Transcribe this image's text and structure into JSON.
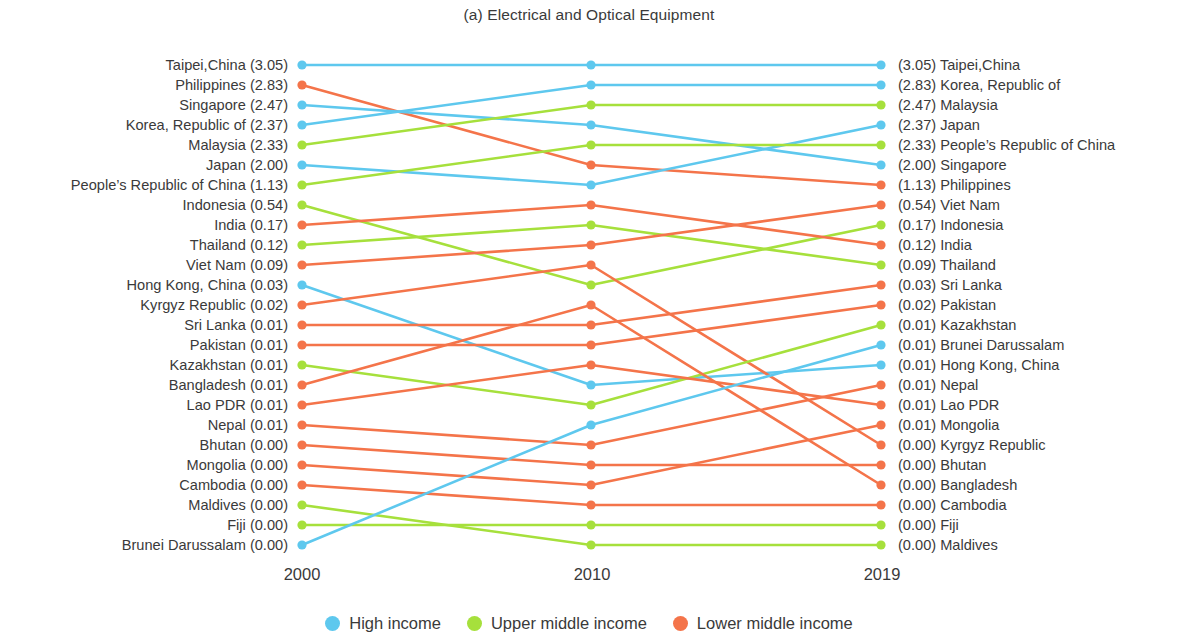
{
  "title": "(a) Electrical and Optical Equipment",
  "colors": {
    "high_income": "#5ec8ee",
    "upper_middle_income": "#a6e03c",
    "lower_middle_income": "#f4744a",
    "text": "#3a3a3a"
  },
  "axis": {
    "ticks": [
      "2000",
      "2010",
      "2019"
    ]
  },
  "legend": [
    {
      "label": "High income",
      "color": "#5ec8ee",
      "key": "high_income"
    },
    {
      "label": "Upper middle income",
      "color": "#a6e03c",
      "key": "upper_middle_income"
    },
    {
      "label": "Lower middle income",
      "color": "#f4744a",
      "key": "lower_middle_income"
    }
  ],
  "chart_data": {
    "type": "line",
    "chart_style": "bump-slope-ranking",
    "title": "(a) Electrical and Optical Equipment",
    "xlabel": "",
    "ylabel": "",
    "x": [
      "2000",
      "2010",
      "2019"
    ],
    "legend_position": "bottom-center",
    "grid": false,
    "axis_note": "Vertical position encodes rank (1 = top). Values in parentheses are shares.",
    "left_column": [
      {
        "rank": 1,
        "name": "Taipei,China",
        "value": "(3.05)",
        "income": "high_income"
      },
      {
        "rank": 2,
        "name": "Philippines",
        "value": "(2.83)",
        "income": "lower_middle_income"
      },
      {
        "rank": 3,
        "name": "Singapore",
        "value": "(2.47)",
        "income": "high_income"
      },
      {
        "rank": 4,
        "name": "Korea, Republic of",
        "value": "(2.37)",
        "income": "high_income"
      },
      {
        "rank": 5,
        "name": "Malaysia",
        "value": "(2.33)",
        "income": "upper_middle_income"
      },
      {
        "rank": 6,
        "name": "Japan",
        "value": "(2.00)",
        "income": "high_income"
      },
      {
        "rank": 7,
        "name": "People’s Republic of China",
        "value": "(1.13)",
        "income": "upper_middle_income"
      },
      {
        "rank": 8,
        "name": "Indonesia",
        "value": "(0.54)",
        "income": "upper_middle_income"
      },
      {
        "rank": 9,
        "name": "India",
        "value": "(0.17)",
        "income": "lower_middle_income"
      },
      {
        "rank": 10,
        "name": "Thailand",
        "value": "(0.12)",
        "income": "upper_middle_income"
      },
      {
        "rank": 11,
        "name": "Viet Nam",
        "value": "(0.09)",
        "income": "lower_middle_income"
      },
      {
        "rank": 12,
        "name": "Hong Kong, China",
        "value": "(0.03)",
        "income": "high_income"
      },
      {
        "rank": 13,
        "name": "Kyrgyz Republic",
        "value": "(0.02)",
        "income": "lower_middle_income"
      },
      {
        "rank": 14,
        "name": "Sri Lanka",
        "value": "(0.01)",
        "income": "lower_middle_income"
      },
      {
        "rank": 15,
        "name": "Pakistan",
        "value": "(0.01)",
        "income": "lower_middle_income"
      },
      {
        "rank": 16,
        "name": "Kazakhstan",
        "value": "(0.01)",
        "income": "upper_middle_income"
      },
      {
        "rank": 17,
        "name": "Bangladesh",
        "value": "(0.01)",
        "income": "lower_middle_income"
      },
      {
        "rank": 18,
        "name": "Lao PDR",
        "value": "(0.01)",
        "income": "lower_middle_income"
      },
      {
        "rank": 19,
        "name": "Nepal",
        "value": "(0.01)",
        "income": "lower_middle_income"
      },
      {
        "rank": 20,
        "name": "Bhutan",
        "value": "(0.00)",
        "income": "lower_middle_income"
      },
      {
        "rank": 21,
        "name": "Mongolia",
        "value": "(0.00)",
        "income": "lower_middle_income"
      },
      {
        "rank": 22,
        "name": "Cambodia",
        "value": "(0.00)",
        "income": "lower_middle_income"
      },
      {
        "rank": 23,
        "name": "Maldives",
        "value": "(0.00)",
        "income": "upper_middle_income"
      },
      {
        "rank": 24,
        "name": "Fiji",
        "value": "(0.00)",
        "income": "upper_middle_income"
      },
      {
        "rank": 25,
        "name": "Brunei Darussalam",
        "value": "(0.00)",
        "income": "high_income"
      }
    ],
    "right_column": [
      {
        "rank": 1,
        "name": "Taipei,China",
        "value": "(3.05)",
        "income": "high_income"
      },
      {
        "rank": 2,
        "name": "Korea, Republic of",
        "value": "(2.83)",
        "income": "high_income"
      },
      {
        "rank": 3,
        "name": "Malaysia",
        "value": "(2.47)",
        "income": "upper_middle_income"
      },
      {
        "rank": 4,
        "name": "Japan",
        "value": "(2.37)",
        "income": "high_income"
      },
      {
        "rank": 5,
        "name": "People’s Republic of China",
        "value": "(2.33)",
        "income": "upper_middle_income"
      },
      {
        "rank": 6,
        "name": "Singapore",
        "value": "(2.00)",
        "income": "high_income"
      },
      {
        "rank": 7,
        "name": "Philippines",
        "value": "(1.13)",
        "income": "lower_middle_income"
      },
      {
        "rank": 8,
        "name": "Viet Nam",
        "value": "(0.54)",
        "income": "lower_middle_income"
      },
      {
        "rank": 9,
        "name": "Indonesia",
        "value": "(0.17)",
        "income": "upper_middle_income"
      },
      {
        "rank": 10,
        "name": "India",
        "value": "(0.12)",
        "income": "lower_middle_income"
      },
      {
        "rank": 11,
        "name": "Thailand",
        "value": "(0.09)",
        "income": "upper_middle_income"
      },
      {
        "rank": 12,
        "name": "Sri Lanka",
        "value": "(0.03)",
        "income": "lower_middle_income"
      },
      {
        "rank": 13,
        "name": "Pakistan",
        "value": "(0.02)",
        "income": "lower_middle_income"
      },
      {
        "rank": 14,
        "name": "Kazakhstan",
        "value": "(0.01)",
        "income": "upper_middle_income"
      },
      {
        "rank": 15,
        "name": "Brunei Darussalam",
        "value": "(0.01)",
        "income": "high_income"
      },
      {
        "rank": 16,
        "name": "Hong Kong, China",
        "value": "(0.01)",
        "income": "high_income"
      },
      {
        "rank": 17,
        "name": "Nepal",
        "value": "(0.01)",
        "income": "lower_middle_income"
      },
      {
        "rank": 18,
        "name": "Lao PDR",
        "value": "(0.01)",
        "income": "lower_middle_income"
      },
      {
        "rank": 19,
        "name": "Mongolia",
        "value": "(0.01)",
        "income": "lower_middle_income"
      },
      {
        "rank": 20,
        "name": "Kyrgyz Republic",
        "value": "(0.00)",
        "income": "lower_middle_income"
      },
      {
        "rank": 21,
        "name": "Bhutan",
        "value": "(0.00)",
        "income": "lower_middle_income"
      },
      {
        "rank": 22,
        "name": "Bangladesh",
        "value": "(0.00)",
        "income": "lower_middle_income"
      },
      {
        "rank": 23,
        "name": "Cambodia",
        "value": "(0.00)",
        "income": "lower_middle_income"
      },
      {
        "rank": 24,
        "name": "Fiji",
        "value": "(0.00)",
        "income": "upper_middle_income"
      },
      {
        "rank": 25,
        "name": "Maldives",
        "value": "(0.00)",
        "income": "upper_middle_income"
      }
    ],
    "series": [
      {
        "name": "Taipei,China",
        "income": "high_income",
        "ranks": [
          1,
          1,
          1
        ],
        "values": [
          "3.05",
          "",
          "3.05"
        ]
      },
      {
        "name": "Philippines",
        "income": "lower_middle_income",
        "ranks": [
          2,
          6,
          7
        ],
        "values": [
          "2.83",
          "",
          "1.13"
        ]
      },
      {
        "name": "Singapore",
        "income": "high_income",
        "ranks": [
          3,
          4,
          6
        ],
        "values": [
          "2.47",
          "",
          "2.00"
        ]
      },
      {
        "name": "Korea, Republic of",
        "income": "high_income",
        "ranks": [
          4,
          2,
          2
        ],
        "values": [
          "2.37",
          "",
          "2.83"
        ]
      },
      {
        "name": "Malaysia",
        "income": "upper_middle_income",
        "ranks": [
          5,
          3,
          3
        ],
        "values": [
          "2.33",
          "",
          "2.47"
        ]
      },
      {
        "name": "Japan",
        "income": "high_income",
        "ranks": [
          6,
          7,
          4
        ],
        "values": [
          "2.00",
          "",
          "2.37"
        ]
      },
      {
        "name": "People’s Republic of China",
        "income": "upper_middle_income",
        "ranks": [
          7,
          5,
          5
        ],
        "values": [
          "1.13",
          "",
          "2.33"
        ]
      },
      {
        "name": "Indonesia",
        "income": "upper_middle_income",
        "ranks": [
          8,
          12,
          9
        ],
        "values": [
          "0.54",
          "",
          "0.17"
        ]
      },
      {
        "name": "India",
        "income": "lower_middle_income",
        "ranks": [
          9,
          8,
          10
        ],
        "values": [
          "0.17",
          "",
          "0.12"
        ]
      },
      {
        "name": "Thailand",
        "income": "upper_middle_income",
        "ranks": [
          10,
          9,
          11
        ],
        "values": [
          "0.12",
          "",
          "0.09"
        ]
      },
      {
        "name": "Viet Nam",
        "income": "lower_middle_income",
        "ranks": [
          11,
          10,
          8
        ],
        "values": [
          "0.09",
          "",
          "0.54"
        ]
      },
      {
        "name": "Hong Kong, China",
        "income": "high_income",
        "ranks": [
          12,
          17,
          16
        ],
        "values": [
          "0.03",
          "",
          "0.01"
        ]
      },
      {
        "name": "Kyrgyz Republic",
        "income": "lower_middle_income",
        "ranks": [
          13,
          11,
          20
        ],
        "values": [
          "0.02",
          "",
          "0.00"
        ]
      },
      {
        "name": "Sri Lanka",
        "income": "lower_middle_income",
        "ranks": [
          14,
          14,
          12
        ],
        "values": [
          "0.01",
          "",
          "0.03"
        ]
      },
      {
        "name": "Pakistan",
        "income": "lower_middle_income",
        "ranks": [
          15,
          15,
          13
        ],
        "values": [
          "0.01",
          "",
          "0.02"
        ]
      },
      {
        "name": "Kazakhstan",
        "income": "upper_middle_income",
        "ranks": [
          16,
          18,
          14
        ],
        "values": [
          "0.01",
          "",
          "0.01"
        ]
      },
      {
        "name": "Bangladesh",
        "income": "lower_middle_income",
        "ranks": [
          17,
          13,
          22
        ],
        "values": [
          "0.01",
          "",
          "0.00"
        ]
      },
      {
        "name": "Lao PDR",
        "income": "lower_middle_income",
        "ranks": [
          18,
          16,
          18
        ],
        "values": [
          "0.01",
          "",
          "0.01"
        ]
      },
      {
        "name": "Nepal",
        "income": "lower_middle_income",
        "ranks": [
          19,
          20,
          17
        ],
        "values": [
          "0.01",
          "",
          "0.01"
        ]
      },
      {
        "name": "Bhutan",
        "income": "lower_middle_income",
        "ranks": [
          20,
          21,
          21
        ],
        "values": [
          "0.00",
          "",
          "0.00"
        ]
      },
      {
        "name": "Mongolia",
        "income": "lower_middle_income",
        "ranks": [
          21,
          22,
          19
        ],
        "values": [
          "0.00",
          "",
          "0.01"
        ]
      },
      {
        "name": "Cambodia",
        "income": "lower_middle_income",
        "ranks": [
          22,
          23,
          23
        ],
        "values": [
          "0.00",
          "",
          "0.00"
        ]
      },
      {
        "name": "Maldives",
        "income": "upper_middle_income",
        "ranks": [
          23,
          25,
          25
        ],
        "values": [
          "0.00",
          "",
          "0.00"
        ]
      },
      {
        "name": "Fiji",
        "income": "upper_middle_income",
        "ranks": [
          24,
          24,
          24
        ],
        "values": [
          "0.00",
          "",
          "0.00"
        ]
      },
      {
        "name": "Brunei Darussalam",
        "income": "high_income",
        "ranks": [
          25,
          19,
          15
        ],
        "values": [
          "0.00",
          "",
          "0.01"
        ]
      }
    ]
  }
}
